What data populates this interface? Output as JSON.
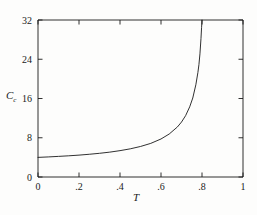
{
  "chart_data": {
    "type": "line",
    "title": "",
    "subtitle": "",
    "xlabel": "T",
    "ylabel": "C",
    "ylabel_sub": "c",
    "xlim": [
      0,
      1
    ],
    "ylim": [
      0,
      32
    ],
    "xticks": [
      0,
      0.2,
      0.4,
      0.6,
      0.8,
      1
    ],
    "xticklabels": [
      "0",
      ".2",
      ".4",
      ".6",
      ".8",
      "1"
    ],
    "yticks": [
      0,
      8,
      16,
      24,
      32
    ],
    "yticklabels": [
      "0",
      "8",
      "16",
      "24",
      "32"
    ],
    "grid": false,
    "legend": null,
    "frame": "box",
    "tick_direction": "in",
    "line_color": "#1a1a1a",
    "line_width": 0.9,
    "background": "#fdfdfc",
    "annotations": [
      "curve diverges (vertical asymptote) near T = 0.8",
      "curve value at T = 0 is approximately 4"
    ],
    "series": [
      {
        "name": "Cc(T)",
        "x": [
          0.0,
          0.05,
          0.1,
          0.15,
          0.2,
          0.25,
          0.3,
          0.35,
          0.4,
          0.45,
          0.5,
          0.55,
          0.6,
          0.64,
          0.68,
          0.7,
          0.72,
          0.74,
          0.755,
          0.77,
          0.78,
          0.785,
          0.79,
          0.795,
          0.798,
          0.8
        ],
        "y": [
          4.0,
          4.09,
          4.2,
          4.32,
          4.46,
          4.63,
          4.83,
          5.07,
          5.37,
          5.74,
          6.22,
          6.85,
          7.75,
          8.76,
          10.2,
          11.2,
          12.5,
          14.3,
          16.1,
          18.8,
          21.3,
          22.9,
          25.1,
          28.2,
          30.5,
          32.0
        ]
      }
    ]
  }
}
